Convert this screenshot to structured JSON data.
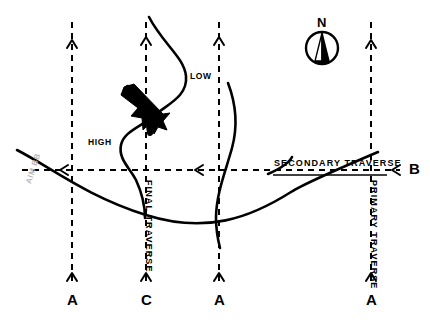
{
  "figure": {
    "type": "weather-traverse-diagram",
    "background_color": "#ffffff",
    "ink_color": "#000000",
    "width": 430,
    "height": 327
  },
  "compass": {
    "label": "N",
    "icon": "compass-rose-icon"
  },
  "pressure_systems": [
    {
      "id": "low",
      "label": "LOW",
      "x": 190,
      "y": 77
    },
    {
      "id": "high",
      "label": "HIGH",
      "x": 88,
      "y": 143
    }
  ],
  "traverse_labels": {
    "secondary": "SECONDARY TRAVERSE",
    "primary": "PRIMARY TRAVERSE",
    "final": "FINAL TRAVERSE"
  },
  "station_labels": [
    {
      "id": "station-a-left",
      "label": "A",
      "x": 67,
      "y": 292
    },
    {
      "id": "station-c",
      "label": "C",
      "x": 141,
      "y": 292
    },
    {
      "id": "station-a-mid",
      "label": "A",
      "x": 214,
      "y": 292
    },
    {
      "id": "station-b",
      "label": "B",
      "x": 409,
      "y": 163
    },
    {
      "id": "station-a-right",
      "label": "A",
      "x": 366,
      "y": 292
    }
  ],
  "vertical_tracks": [
    {
      "id": "track-a-left",
      "x": 72,
      "top": 22,
      "bottom": 285
    },
    {
      "id": "track-c",
      "x": 146,
      "top": 22,
      "bottom": 285
    },
    {
      "id": "track-a-mid",
      "x": 219,
      "top": 22,
      "bottom": 285
    },
    {
      "id": "track-a-right",
      "x": 371,
      "top": 22,
      "bottom": 285
    }
  ],
  "horizontal_track": {
    "id": "track-b",
    "y": 170,
    "left": 22,
    "right": 400
  },
  "aircraft_symbol": {
    "id": "aircraft-frontal-symbol",
    "x": 145,
    "y": 110
  },
  "watermark": {
    "text": "AIM BB"
  }
}
